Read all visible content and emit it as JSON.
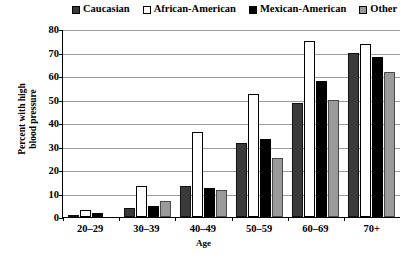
{
  "chart_data": {
    "type": "bar",
    "title": "",
    "xlabel": "Age",
    "ylabel": "Percent with high blood pressure",
    "ylim": [
      0,
      80
    ],
    "ytick_step": 10,
    "yticks": [
      0,
      10,
      20,
      30,
      40,
      50,
      60,
      70,
      80
    ],
    "ytick_labels": [
      "0",
      "10",
      "20",
      "30",
      "40",
      "50",
      "60",
      "70",
      "80"
    ],
    "grid": "horizontal",
    "legend_position": "top",
    "categories": [
      "20–29",
      "30–39",
      "40–49",
      "50–59",
      "60–69",
      "70+"
    ],
    "series": [
      {
        "name": "Caucasian",
        "color": "#3a3a3a",
        "values": [
          1,
          4,
          13,
          31.5,
          48.5,
          70
        ]
      },
      {
        "name": "African-American",
        "color": "#ffffff",
        "values": [
          3,
          13,
          36,
          52.5,
          75,
          73.5
        ]
      },
      {
        "name": "Mexican-American",
        "color": "#000000",
        "values": [
          1.5,
          4.5,
          12.5,
          33,
          58,
          68
        ]
      },
      {
        "name": "Other",
        "color": "#9a9a9a",
        "values": [
          0,
          7,
          11.5,
          25,
          50,
          61.5
        ]
      }
    ]
  },
  "legend": {
    "items": [
      {
        "label": "Caucasian",
        "swatch": "swatch-caucasian-icon"
      },
      {
        "label": "African-American",
        "swatch": "swatch-african-american-icon"
      },
      {
        "label": "Mexican-American",
        "swatch": "swatch-mexican-american-icon"
      },
      {
        "label": "Other",
        "swatch": "swatch-other-icon"
      }
    ]
  },
  "axes": {
    "y_title": "Percent with high blood pressure",
    "y_title_line1": "Percent with high",
    "y_title_line2": "blood pressure",
    "x_title": "Age"
  }
}
